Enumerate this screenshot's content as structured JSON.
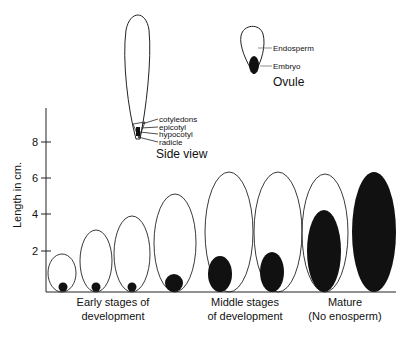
{
  "figure": {
    "y_axis": {
      "label": "Length in cm.",
      "ticks": [
        "2",
        "4",
        "6",
        "8"
      ]
    },
    "side_view": {
      "title": "Side view",
      "parts": [
        "cotyledons",
        "epicotyl",
        "hypocotyl",
        "radicle"
      ]
    },
    "ovule": {
      "title": "Ovule",
      "parts": [
        "Endosperm",
        "Embryo"
      ]
    },
    "stage_labels": [
      {
        "line1": "Early stages of",
        "line2": "development"
      },
      {
        "line1": "Middle stages",
        "line2": "of development"
      },
      {
        "line1": "Mature",
        "line2": "(No enosperm)"
      }
    ],
    "seeds": [
      {
        "stage": "early",
        "ovule_length_cm": 2.0,
        "embryo_length_cm": 0.5
      },
      {
        "stage": "early",
        "ovule_length_cm": 3.3,
        "embryo_length_cm": 0.5
      },
      {
        "stage": "early",
        "ovule_length_cm": 4.0,
        "embryo_length_cm": 0.5
      },
      {
        "stage": "early",
        "ovule_length_cm": 5.2,
        "embryo_length_cm": 1.0
      },
      {
        "stage": "middle",
        "ovule_length_cm": 6.4,
        "embryo_length_cm": 1.9
      },
      {
        "stage": "middle",
        "ovule_length_cm": 6.4,
        "embryo_length_cm": 2.1
      },
      {
        "stage": "mature",
        "ovule_length_cm": 6.3,
        "embryo_length_cm": 5.0
      },
      {
        "stage": "mature",
        "ovule_length_cm": 6.3,
        "embryo_length_cm": 6.3
      }
    ],
    "colors": {
      "ink": "#111111",
      "background": "#ffffff"
    }
  }
}
